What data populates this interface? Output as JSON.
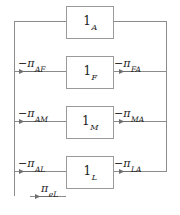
{
  "diagram": {
    "type": "block-flow-loop-diagram",
    "line_color": "#8c8c8c",
    "text_color": "#1a1a1a",
    "background": "#ffffff",
    "nodes": [
      {
        "id": "A",
        "prefix": "1",
        "subscript": "A",
        "label": "1_A"
      },
      {
        "id": "F",
        "prefix": "1",
        "subscript": "F",
        "label": "1_F"
      },
      {
        "id": "M",
        "prefix": "1",
        "subscript": "M",
        "label": "1_M"
      },
      {
        "id": "L",
        "prefix": "1",
        "subscript": "L",
        "label": "1_L"
      }
    ],
    "edge_labels": [
      {
        "id": "AF",
        "sign": "−",
        "symbol": "π",
        "subscript": "AF",
        "side": "left",
        "text": "−π_AF"
      },
      {
        "id": "FA",
        "sign": "−",
        "symbol": "π",
        "subscript": "FA",
        "side": "right",
        "text": "−π_FA"
      },
      {
        "id": "AM",
        "sign": "−",
        "symbol": "π",
        "subscript": "AM",
        "side": "left",
        "text": "−π_AM"
      },
      {
        "id": "MA",
        "sign": "−",
        "symbol": "π",
        "subscript": "MA",
        "side": "right",
        "text": "−π_MA"
      },
      {
        "id": "AL",
        "sign": "−",
        "symbol": "π",
        "subscript": "AL",
        "side": "left",
        "text": "−π_AL"
      },
      {
        "id": "LA",
        "sign": "−",
        "symbol": "π",
        "subscript": "LA",
        "side": "right",
        "text": "−π_LA"
      },
      {
        "id": "eL",
        "sign": "",
        "symbol": "π",
        "subscript": "eL",
        "side": "bottom",
        "text": "π_eL"
      }
    ]
  }
}
